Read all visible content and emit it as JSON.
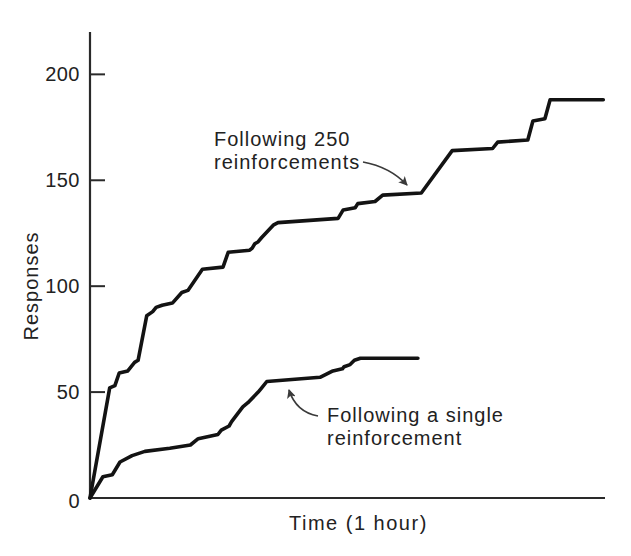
{
  "figure": {
    "background": "#ffffff",
    "curve_color": "#131313",
    "axis_color": "#2a2a2a",
    "text_color": "#262626",
    "arrow_color": "#3a3a3a"
  },
  "chart_data": {
    "type": "line",
    "subtype": "cumulative-record-extinction-curves",
    "title": "",
    "xlabel": "Time (1 hour)",
    "ylabel": "Responses",
    "x_unit": "minutes",
    "xlim": [
      0,
      60
    ],
    "ylim": [
      0,
      220
    ],
    "x_ticks": [],
    "y_ticks": [
      0,
      50,
      100,
      150,
      200
    ],
    "grid": false,
    "legend_position": "none (inline text annotations with arrows)",
    "series": [
      {
        "name": "Following 250 reinforcements",
        "points": [
          [
            0,
            0
          ],
          [
            2.3,
            52
          ],
          [
            2.9,
            53
          ],
          [
            3.4,
            59
          ],
          [
            4.4,
            60
          ],
          [
            4.8,
            62
          ],
          [
            5.2,
            64
          ],
          [
            5.6,
            65
          ],
          [
            6.6,
            86
          ],
          [
            7.3,
            88
          ],
          [
            7.7,
            90
          ],
          [
            8.4,
            91
          ],
          [
            9.6,
            92
          ],
          [
            10.7,
            97
          ],
          [
            11.4,
            98
          ],
          [
            13.1,
            108
          ],
          [
            15.5,
            109
          ],
          [
            16.1,
            116
          ],
          [
            18.6,
            117
          ],
          [
            18.9,
            118
          ],
          [
            19.2,
            120
          ],
          [
            19.6,
            121
          ],
          [
            20.0,
            123
          ],
          [
            21.4,
            129
          ],
          [
            21.9,
            130
          ],
          [
            28.9,
            132
          ],
          [
            29.5,
            136
          ],
          [
            30.9,
            137
          ],
          [
            31.2,
            139
          ],
          [
            33.2,
            140
          ],
          [
            34.1,
            143
          ],
          [
            38.6,
            144
          ],
          [
            42.2,
            164
          ],
          [
            46.9,
            165
          ],
          [
            47.5,
            168
          ],
          [
            51.0,
            169
          ],
          [
            51.6,
            178
          ],
          [
            53.0,
            179
          ],
          [
            53.6,
            188
          ],
          [
            59.8,
            188
          ]
        ]
      },
      {
        "name": "Following a single reinforcement",
        "points": [
          [
            0,
            0
          ],
          [
            1.5,
            10
          ],
          [
            2.6,
            11
          ],
          [
            3.5,
            17
          ],
          [
            4.9,
            20
          ],
          [
            6.4,
            22
          ],
          [
            9.3,
            23.5
          ],
          [
            11.7,
            25
          ],
          [
            12.6,
            28
          ],
          [
            14.9,
            30
          ],
          [
            15.3,
            32
          ],
          [
            16.2,
            34
          ],
          [
            16.5,
            36
          ],
          [
            17.8,
            43
          ],
          [
            18.4,
            45
          ],
          [
            19.6,
            50
          ],
          [
            20.0,
            52
          ],
          [
            20.6,
            55
          ],
          [
            26.8,
            57
          ],
          [
            28.3,
            60
          ],
          [
            29.4,
            61
          ],
          [
            29.6,
            62
          ],
          [
            30.3,
            63
          ],
          [
            30.8,
            65
          ],
          [
            31.5,
            66
          ],
          [
            38.2,
            66
          ]
        ]
      }
    ],
    "annotations": [
      {
        "line1": "Following 250",
        "line2": "reinforcements",
        "arrow_points_to": "upper curve plateau near 143 responses"
      },
      {
        "line1": "Following a single",
        "line2": "reinforcement",
        "arrow_points_to": "lower curve plateau near 55 responses"
      }
    ]
  }
}
